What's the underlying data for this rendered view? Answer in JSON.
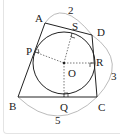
{
  "figure": {
    "vertices": {
      "A": "A",
      "B": "B",
      "C": "C",
      "D": "D"
    },
    "center": "O",
    "tangent_points": {
      "P": "P",
      "Q": "Q",
      "R": "R",
      "S": "S"
    },
    "measurements": {
      "AD": "2",
      "DC": "3",
      "BC": "5"
    },
    "colors": {
      "line": "#222222",
      "arc": "#aaaaaa",
      "frame": "#e4e4e4"
    }
  }
}
